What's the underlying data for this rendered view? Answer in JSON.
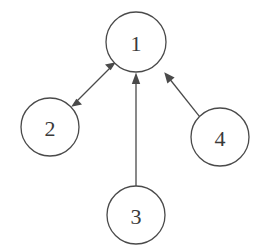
{
  "diagram": {
    "background_color": "#ffffff",
    "stroke_color": "#4a4a4a",
    "label_color": "#3a3a3a",
    "canvas": {
      "width": 263,
      "height": 251
    },
    "nodes": [
      {
        "id": "n1",
        "label": "1",
        "cx": 136,
        "cy": 42,
        "r": 30
      },
      {
        "id": "n2",
        "label": "2",
        "cx": 50,
        "cy": 127,
        "r": 29
      },
      {
        "id": "n3",
        "label": "3",
        "cx": 136,
        "cy": 215,
        "r": 29
      },
      {
        "id": "n4",
        "label": "4",
        "cx": 220,
        "cy": 137,
        "r": 29
      }
    ],
    "edges": [
      {
        "id": "e12",
        "from": "n1",
        "to": "n2",
        "direction": "bidirectional",
        "label": ""
      },
      {
        "id": "e31",
        "from": "n3",
        "to": "n1",
        "direction": "forward",
        "label": ""
      },
      {
        "id": "e41",
        "from": "n4",
        "to": "n1",
        "direction": "forward",
        "label": ""
      }
    ]
  }
}
